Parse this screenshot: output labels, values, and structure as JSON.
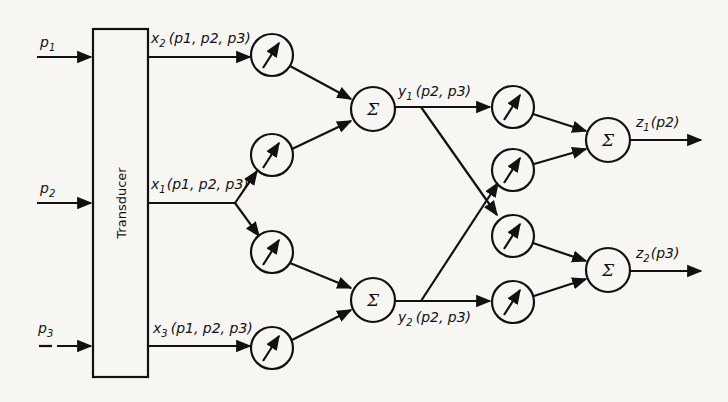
{
  "diagram": {
    "transducer": {
      "label": "Transducer"
    },
    "inputs": [
      {
        "name": "p",
        "sub": "1"
      },
      {
        "name": "p",
        "sub": "2"
      },
      {
        "name": "p",
        "sub": "3"
      }
    ],
    "transducer_outputs": [
      {
        "var": "x",
        "sub": "2",
        "args": "(p1, p2, p3)"
      },
      {
        "var": "x",
        "sub": "1",
        "args": "(p1, p2, p3)"
      },
      {
        "var": "x",
        "sub": "3",
        "args": "(p1, p2, p3)"
      }
    ],
    "layer1_meters": 4,
    "layer1_sums": [
      {
        "symbol": "Σ",
        "output_var": "y",
        "output_sub": "1",
        "args": "(p2, p3)"
      },
      {
        "symbol": "Σ",
        "output_var": "y",
        "output_sub": "2",
        "args": "(p2, p3)"
      }
    ],
    "layer2_meters": 4,
    "layer2_sums": [
      {
        "symbol": "Σ",
        "output_var": "z",
        "output_sub": "1",
        "args": "(p2)"
      },
      {
        "symbol": "Σ",
        "output_var": "z",
        "output_sub": "2",
        "args": "(p3)"
      }
    ],
    "colors": {
      "ink": "#111111",
      "paper": "#f7f6f3"
    }
  }
}
